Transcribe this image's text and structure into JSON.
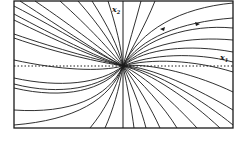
{
  "figure": {
    "type": "phase-portrait",
    "axes": {
      "x_label": "x",
      "x_sub": "1",
      "y_label": "x",
      "y_sub": "2"
    },
    "frame": {
      "left": 14,
      "top": 1,
      "right": 233,
      "bottom": 128
    },
    "origin": {
      "x": 123,
      "y": 66
    },
    "arrow_markers": [
      {
        "x": 163,
        "y": 29,
        "direction": "left"
      },
      {
        "x": 198,
        "y": 24,
        "direction": "right"
      }
    ],
    "stroke_color": "#1a1a1a",
    "background_color": "#ffffff"
  }
}
